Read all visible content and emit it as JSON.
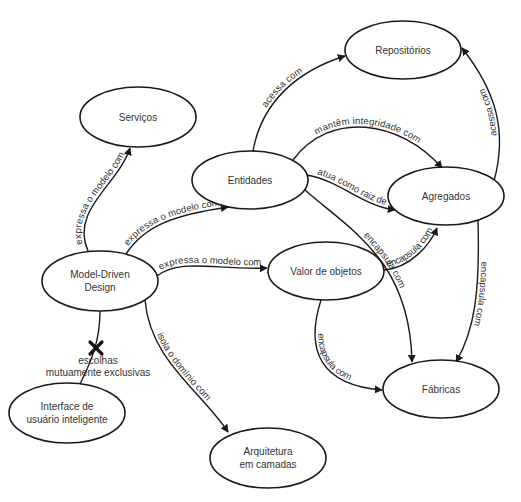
{
  "diagram": {
    "type": "concept-map",
    "nodes": [
      {
        "id": "servicos",
        "label_lines": [
          "Serviços"
        ],
        "cx": 138,
        "cy": 117,
        "rx": 58,
        "ry": 30
      },
      {
        "id": "repositorios",
        "label_lines": [
          "Repositórios"
        ],
        "cx": 403,
        "cy": 50,
        "rx": 58,
        "ry": 29
      },
      {
        "id": "entidades",
        "label_lines": [
          "Entidades"
        ],
        "cx": 250,
        "cy": 180,
        "rx": 58,
        "ry": 29
      },
      {
        "id": "agregados",
        "label_lines": [
          "Agregados"
        ],
        "cx": 446,
        "cy": 196,
        "rx": 58,
        "ry": 29
      },
      {
        "id": "model_driven_design",
        "label_lines": [
          "Model-Driven",
          "Design"
        ],
        "cx": 100,
        "cy": 281,
        "rx": 58,
        "ry": 30
      },
      {
        "id": "valor_de_objetos",
        "label_lines": [
          "Valor de objetos"
        ],
        "cx": 326,
        "cy": 271,
        "rx": 58,
        "ry": 29
      },
      {
        "id": "interface_usuario",
        "label_lines": [
          "Interface de",
          "usuário inteligente"
        ],
        "cx": 67,
        "cy": 413,
        "rx": 58,
        "ry": 30
      },
      {
        "id": "fabricas",
        "label_lines": [
          "Fábricas"
        ],
        "cx": 441,
        "cy": 389,
        "rx": 58,
        "ry": 29
      },
      {
        "id": "arquitetura_camadas",
        "label_lines": [
          "Arquitetura",
          "em camadas"
        ],
        "cx": 268,
        "cy": 458,
        "rx": 58,
        "ry": 30
      }
    ],
    "edges": [
      {
        "id": "e1",
        "from": "model_driven_design",
        "to": "servicos",
        "label": "expressa o modelo com",
        "path": "M 88 251 C 70 210, 118 185, 130 148",
        "arrow": true
      },
      {
        "id": "e2",
        "from": "model_driven_design",
        "to": "entidades",
        "label": "expressa o modelo com",
        "path": "M 126 254 C 145 225, 175 215, 228 207",
        "arrow": true
      },
      {
        "id": "e3",
        "from": "model_driven_design",
        "to": "valor_de_objetos",
        "label": "expressa o modelo com",
        "path": "M 157 276 C 180 258, 215 270, 267 268",
        "arrow": true
      },
      {
        "id": "e4",
        "from": "model_driven_design",
        "to": "arquitetura_camadas",
        "label": "isola o domínio com",
        "path": "M 145 300 C 150 360, 200 390, 228 432",
        "arrow": true
      },
      {
        "id": "e5",
        "from": "entidades",
        "to": "repositorios",
        "label": "acessa com",
        "path": "M 253 151 C 262 100, 300 70, 345 56",
        "arrow": true
      },
      {
        "id": "e6",
        "from": "entidades",
        "to": "agregados",
        "label": "mantêm integridade com",
        "path": "M 293 160 C 330 110, 400 120, 442 168",
        "arrow": true
      },
      {
        "id": "e7",
        "from": "entidades",
        "to": "agregados",
        "label": "atua como raiz de",
        "path": "M 306 175 C 340 180, 360 205, 395 210",
        "arrow": true
      },
      {
        "id": "e8",
        "from": "entidades",
        "to": "fabricas",
        "label": "encapsula com",
        "path": "M 305 190 C 350 230, 410 260, 412 362",
        "arrow": true
      },
      {
        "id": "e9",
        "from": "agregados",
        "to": "repositorios",
        "label": "acessa com",
        "path": "M 494 181 C 508 130, 495 90, 462 48",
        "arrow": true
      },
      {
        "id": "e10",
        "from": "agregados",
        "to": "fabricas",
        "label": "encapsula com",
        "path": "M 478 221 C 480 290, 475 330, 456 362",
        "arrow": true
      },
      {
        "id": "e11",
        "from": "valor_de_objetos",
        "to": "agregados",
        "label": "encapsula com",
        "path": "M 384 270 C 410 268, 430 245, 437 228",
        "arrow": true
      },
      {
        "id": "e12",
        "from": "valor_de_objetos",
        "to": "fabricas",
        "label": "encapsula com",
        "path": "M 321 300 C 305 350, 320 385, 382 390",
        "arrow": true
      },
      {
        "id": "e13",
        "from": "model_driven_design",
        "to": "interface_usuario",
        "label": "",
        "path": "M 100 311 C 100 340, 92 360, 80 384",
        "arrow": false
      }
    ],
    "annotations": [
      {
        "id": "mutually-exclusive",
        "lines": [
          "escolhas",
          "mutuamente exclusivas"
        ],
        "x": 98,
        "y": 364,
        "marker": "x",
        "marker_x": 96,
        "marker_y": 348
      }
    ],
    "colors": {
      "stroke": "#1a1a1a",
      "text": "#333333",
      "background": "#ffffff"
    }
  }
}
